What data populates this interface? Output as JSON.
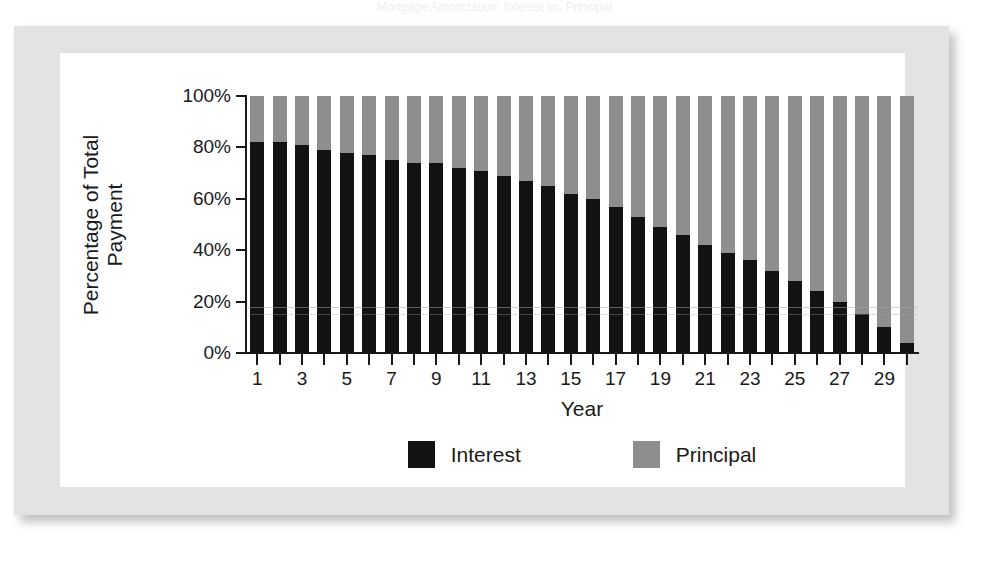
{
  "figure": {
    "cropped_title": "Mortgage Amortization: Interest vs. Principal",
    "xlabel": "Year",
    "ylabel_line1": "Percentage of Total",
    "ylabel_line2": "Payment"
  },
  "legend": {
    "position": "bottom-center",
    "entries": [
      {
        "label": "Interest",
        "color": "#121212",
        "swatch": "legend-swatch-interest"
      },
      {
        "label": "Principal",
        "color": "#8e8e8e",
        "swatch": "legend-swatch-principal"
      }
    ]
  },
  "colors": {
    "interest": "#121212",
    "principal": "#8e8e8e",
    "axis": "#1a1a1a",
    "frame": "#e3e3e3",
    "plot_background": "#ffffff"
  },
  "chart_data": {
    "type": "bar",
    "stacked": true,
    "title": "Mortgage Amortization: Interest vs. Principal",
    "xlabel": "Year",
    "ylabel": "Percentage of Total Payment",
    "grid": false,
    "legend_position": "bottom-center",
    "ylim": [
      0,
      100
    ],
    "ytick_values": [
      0,
      20,
      40,
      60,
      80,
      100
    ],
    "ytick_labels": [
      "0%",
      "20%",
      "40%",
      "60%",
      "80%",
      "100%"
    ],
    "xlim": [
      0.5,
      30.5
    ],
    "categories": [
      1,
      2,
      3,
      4,
      5,
      6,
      7,
      8,
      9,
      10,
      11,
      12,
      13,
      14,
      15,
      16,
      17,
      18,
      19,
      20,
      21,
      22,
      23,
      24,
      25,
      26,
      27,
      28,
      29,
      30
    ],
    "xtick_labels": [
      "1",
      "3",
      "5",
      "7",
      "9",
      "11",
      "13",
      "15",
      "17",
      "19",
      "21",
      "23",
      "25",
      "27",
      "29"
    ],
    "xtick_values": [
      1,
      3,
      5,
      7,
      9,
      11,
      13,
      15,
      17,
      19,
      21,
      23,
      25,
      27,
      29
    ],
    "series": [
      {
        "name": "Interest",
        "color": "#121212",
        "values": [
          82,
          82,
          81,
          79,
          78,
          77,
          75,
          74,
          74,
          72,
          71,
          69,
          67,
          65,
          62,
          60,
          57,
          53,
          49,
          46,
          42,
          39,
          36,
          32,
          28,
          24,
          20,
          15,
          10,
          4
        ]
      },
      {
        "name": "Principal",
        "color": "#8e8e8e",
        "values": [
          18,
          18,
          19,
          21,
          22,
          23,
          25,
          26,
          26,
          28,
          29,
          31,
          33,
          35,
          38,
          40,
          43,
          47,
          51,
          54,
          58,
          61,
          64,
          68,
          72,
          76,
          80,
          85,
          90,
          96
        ]
      }
    ]
  }
}
